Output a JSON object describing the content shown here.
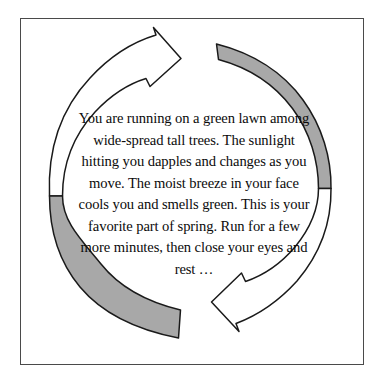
{
  "figure": {
    "name": "cyclical-guided-imagery-diagram",
    "frame": {
      "border_color": "#4a4a4a",
      "background_color": "#ffffff"
    },
    "body_text": "You are running on a green lawn among wide-spread tall trees. The sunlight hitting you dapples and changes as you move. The moist breeze in your face cools you and smells green. This is your favorite part of spring. Run for a few more minutes, then close your eyes and rest …",
    "body_text_lines": [
      "You are running on a green lawn",
      "among wide-spread tall trees. The",
      "sunlight hitting you dapples and",
      "changes as you move. The moist",
      "breeze in your face cools you and",
      "smells green. This is your favorite",
      "part of spring. Run for a few more",
      "minutes, then close your eyes and",
      "rest …"
    ],
    "colors": {
      "arrow_outline": "#1a1a1a",
      "arrow_fill_white": "#ffffff",
      "arrow_fill_gray": "#a8a8a8",
      "text": "#0b0b0b"
    },
    "arrows": [
      {
        "id": "upper-left-white-arrow",
        "fill": "white",
        "direction": "clockwise",
        "head_position": "top-center",
        "head_points": "right"
      },
      {
        "id": "right-gray-arc",
        "fill": "gray",
        "direction": "clockwise",
        "tail_position": "top-right",
        "tail_shape": "blunt"
      },
      {
        "id": "lower-right-white-arrow",
        "fill": "white",
        "direction": "clockwise",
        "head_position": "bottom-center",
        "head_points": "left"
      },
      {
        "id": "left-gray-arc",
        "fill": "gray",
        "direction": "clockwise",
        "tail_position": "bottom-left",
        "tail_shape": "blunt"
      }
    ]
  }
}
